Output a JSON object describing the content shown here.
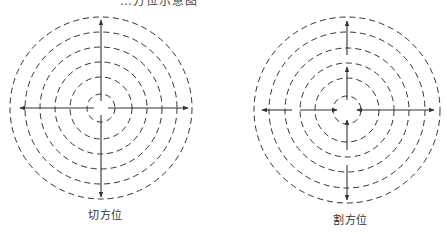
{
  "figure": {
    "top_caption_partial": "…方位示意图",
    "stroke_color": "#333333",
    "panels": [
      {
        "id": "tangent",
        "label": "切方位",
        "center": [
          101,
          108
        ],
        "radii": [
          91,
          76,
          61,
          46,
          31,
          14
        ],
        "description": "Continuous axes with outward arrows from center"
      },
      {
        "id": "secant",
        "label": "割方位",
        "center": [
          347,
          110
        ],
        "radii": [
          93,
          78,
          62,
          47,
          32,
          14
        ],
        "description": "Segmented axes with arrows pointing both inward and outward"
      }
    ]
  }
}
